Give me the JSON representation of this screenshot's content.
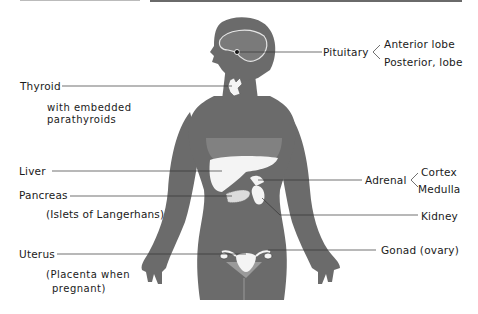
{
  "colors": {
    "body": "#6b6b6b",
    "body_light": "#8a8a8a",
    "organ": "#f4f4f4",
    "line": "#333333",
    "text": "#1a1a1a"
  },
  "labels": {
    "pituitary": "Pituitary",
    "pituitary_anterior": "Anterior lobe",
    "pituitary_posterior": "Posterior, lobe",
    "thyroid": "Thyroid",
    "thyroid_note_1": "with embedded",
    "thyroid_note_2": "parathyroids",
    "liver": "Liver",
    "pancreas": "Pancreas",
    "pancreas_note": "(Islets of Langerhans)",
    "adrenal": "Adrenal",
    "adrenal_cortex": "Cortex",
    "adrenal_medulla": "Medulla",
    "kidney": "Kidney",
    "uterus": "Uterus",
    "uterus_note_1": "(Placenta when",
    "uterus_note_2": "pregnant)",
    "gonad": "Gonad (ovary)"
  }
}
